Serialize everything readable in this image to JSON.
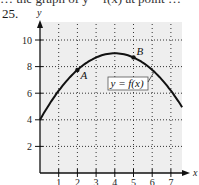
{
  "header": {
    "cutoff_text": "… the graph of y = f(x) at point …",
    "problem_number": "25."
  },
  "chart_data": {
    "type": "line",
    "title": "",
    "xlabel": "x",
    "ylabel": "y",
    "xlim": [
      0,
      7.7
    ],
    "ylim": [
      0,
      10.5
    ],
    "x_ticks": [
      1,
      2,
      3,
      4,
      5,
      6,
      7
    ],
    "y_ticks": [
      2,
      4,
      6,
      8,
      10
    ],
    "grid": true,
    "grid_style": "dotted",
    "background": "#eeeeee",
    "series": [
      {
        "name": "y = f(x)",
        "description": "downward parabola, vertex (4, 9), y-intercept (0, 4)",
        "x": [
          0,
          0.5,
          1,
          1.5,
          2,
          2.5,
          3,
          3.5,
          4,
          4.5,
          5,
          5.5,
          6,
          6.5,
          7,
          7.6
        ],
        "y": [
          4,
          5.17,
          6.19,
          7.05,
          7.75,
          8.3,
          8.69,
          8.92,
          9,
          8.92,
          8.69,
          8.3,
          7.75,
          7.05,
          6.19,
          4.95
        ],
        "color": "#111111"
      }
    ],
    "points": [
      {
        "label": "A",
        "x": 2,
        "y": 7.75
      },
      {
        "label": "B",
        "x": 5,
        "y": 8.69
      }
    ],
    "annotations": [
      {
        "text": "y = f(x)",
        "boxed": true,
        "points_to": {
          "x": 6.1,
          "y": 7.6
        }
      }
    ]
  }
}
